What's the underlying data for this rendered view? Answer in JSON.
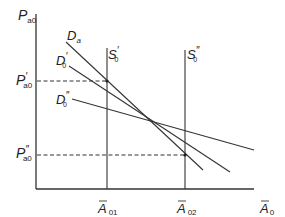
{
  "diagram": {
    "type": "supply-demand economics diagram",
    "axes": {
      "y_label": {
        "main": "P",
        "sub": "a0"
      },
      "x_label": {
        "main": "A",
        "sub": "0",
        "overbar": true
      }
    },
    "x_ticks": [
      {
        "main": "A",
        "sub": "01",
        "overbar": true
      },
      {
        "main": "A",
        "sub": "02",
        "overbar": true
      }
    ],
    "y_ticks": [
      {
        "main": "P",
        "prime": "′",
        "sub": "a0"
      },
      {
        "main": "P",
        "prime": "″",
        "sub": "a0"
      }
    ],
    "curves": {
      "Da": {
        "main": "D",
        "sub": "a"
      },
      "D0_prime": {
        "main": "D",
        "prime": "′",
        "sub": "0"
      },
      "D0_double_prime": {
        "main": "D",
        "prime": "″",
        "sub": "0"
      },
      "S0_prime": {
        "main": "S",
        "prime": "′",
        "sub": "0"
      },
      "S0_double_prime": {
        "main": "S",
        "prime": "″",
        "sub": "0"
      }
    },
    "colors": {
      "line": "#333333",
      "text": "#222222",
      "background": "#ffffff"
    }
  }
}
